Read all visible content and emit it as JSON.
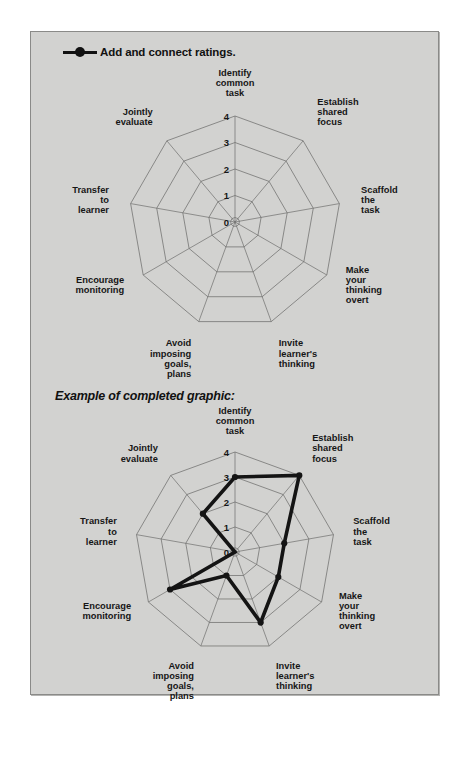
{
  "page": {
    "background_color": "#ffffff",
    "panel_color": "#d2d2d0",
    "border_color": "#8a8a88",
    "text_color": "#161616"
  },
  "legend": {
    "marker_name": "line-dot-marker",
    "label": "Add and connect ratings.",
    "color": "#111111"
  },
  "section_caption": "Example of completed graphic:",
  "chart_data": [
    {
      "id": "blank-radar",
      "type": "radar",
      "title": "",
      "categories": [
        "Identify common task",
        "Establish shared focus",
        "Scaffold the task",
        "Make your thinking overt",
        "Invite learner's thinking",
        "Avoid imposing goals, plans",
        "Encourage monitoring",
        "Transfer to learner",
        "Jointly evaluate"
      ],
      "category_lines": [
        [
          "Identify",
          "common",
          "task"
        ],
        [
          "Establish",
          "shared",
          "focus"
        ],
        [
          "Scaffold",
          "the",
          "task"
        ],
        [
          "Make",
          "your",
          "thinking",
          "overt"
        ],
        [
          "Invite",
          "learner's",
          "thinking"
        ],
        [
          "Avoid",
          "imposing",
          "goals,",
          "plans"
        ],
        [
          "Encourage",
          "monitoring"
        ],
        [
          "Transfer",
          "to",
          "learner"
        ],
        [
          "Jointly",
          "evaluate"
        ]
      ],
      "tick_labels": [
        "0",
        "1",
        "2",
        "3",
        "4"
      ],
      "rlim": [
        0,
        4
      ],
      "grid": true,
      "values": [],
      "legend_position": "top-left"
    },
    {
      "id": "completed-radar",
      "type": "radar",
      "title": "Example of completed graphic:",
      "categories": [
        "Identify common task",
        "Establish shared focus",
        "Scaffold the task",
        "Make your thinking overt",
        "Invite learner's thinking",
        "Avoid imposing goals, plans",
        "Encourage monitoring",
        "Transfer to learner",
        "Jointly evaluate"
      ],
      "category_lines": [
        [
          "Identify",
          "common",
          "task"
        ],
        [
          "Establish",
          "shared",
          "focus"
        ],
        [
          "Scaffold",
          "the",
          "task"
        ],
        [
          "Make",
          "your",
          "thinking",
          "overt"
        ],
        [
          "Invite",
          "learner's",
          "thinking"
        ],
        [
          "Avoid",
          "imposing",
          "goals,",
          "plans"
        ],
        [
          "Encourage",
          "monitoring"
        ],
        [
          "Transfer",
          "to",
          "learner"
        ],
        [
          "Jointly",
          "evaluate"
        ]
      ],
      "tick_labels": [
        "0",
        "1",
        "2",
        "3",
        "4"
      ],
      "rlim": [
        0,
        4
      ],
      "grid": true,
      "series": [
        {
          "name": "Add and connect ratings.",
          "values": [
            3,
            4,
            2,
            2,
            3,
            1,
            3,
            0,
            2
          ],
          "color": "#141414"
        }
      ],
      "legend_position": "none"
    }
  ]
}
